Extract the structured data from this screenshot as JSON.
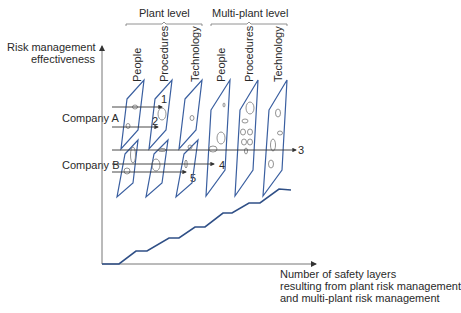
{
  "groups": {
    "plant": "Plant level",
    "multi": "Multi-plant level"
  },
  "columns": [
    "People",
    "Procedures",
    "Technology",
    "People",
    "Procedures",
    "Technology"
  ],
  "y_axis": {
    "line1": "Risk management",
    "line2": "effectiveness"
  },
  "x_axis": {
    "line1": "Number of safety layers",
    "line2": "resulting from plant risk management",
    "line3": "and multi-plant risk management"
  },
  "companies": {
    "a": "Company A",
    "b": "Company B"
  },
  "trajectories": [
    "1",
    "2",
    "3",
    "4",
    "5"
  ],
  "colors": {
    "slice": "#3a5fa0",
    "curve": "#2f4f86",
    "axis": "#777777",
    "text": "#2a2a2a"
  }
}
